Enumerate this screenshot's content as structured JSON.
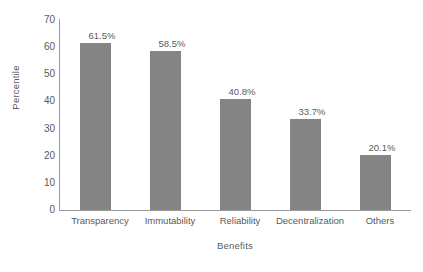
{
  "chart_data": {
    "type": "bar",
    "title": "",
    "xlabel": "Benefits",
    "ylabel": "Percentile",
    "categories": [
      "Transparency",
      "Immutability",
      "Reliability",
      "Decentralization",
      "Others"
    ],
    "values": [
      61.5,
      58.5,
      40.8,
      33.7,
      20.1
    ],
    "value_labels": [
      "61.5%",
      "58.5%",
      "40.8%",
      "33.7%",
      "20.1%"
    ],
    "ylim": [
      0,
      70
    ],
    "yticks": [
      70,
      60,
      50,
      40,
      30,
      20,
      10,
      0
    ],
    "ytick_labels": [
      "70",
      "60",
      "50",
      "40",
      "30",
      "20",
      "10",
      "0"
    ],
    "grid": false,
    "legend": false,
    "bar_color": "#848484",
    "axis_color": "#9a9a9a",
    "text_color": "#5a5a5a",
    "background_color": "#ffffff"
  }
}
